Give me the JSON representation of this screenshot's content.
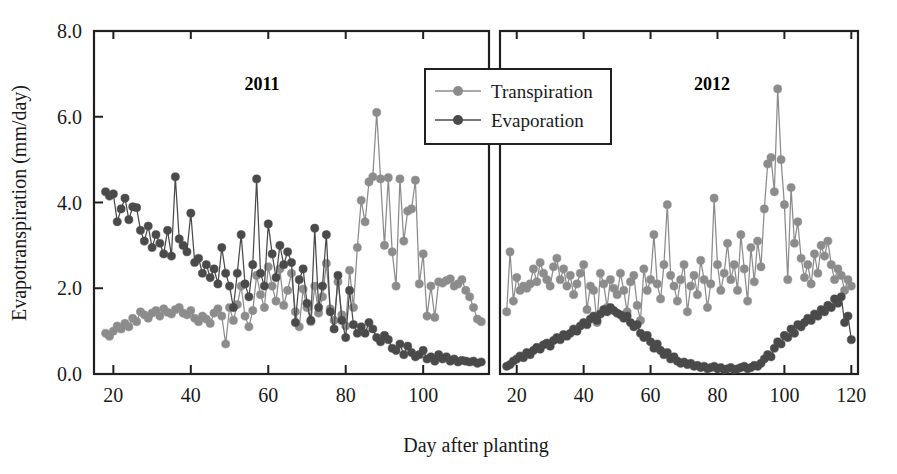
{
  "chart_data": {
    "type": "line",
    "title": "",
    "xlabel": "Day after planting",
    "ylabel": "Evapotranspiration (mm/day)",
    "ylim": [
      0.0,
      8.0
    ],
    "yticks": [
      "0.0",
      "2.0",
      "4.0",
      "6.0",
      "8.0"
    ],
    "ytick_values": [
      0.0,
      2.0,
      4.0,
      6.0,
      8.0
    ],
    "grid": false,
    "legend_position": "top-center",
    "marker": "filled-circle",
    "panels": [
      {
        "label": "2011",
        "xlim": [
          15,
          117
        ],
        "xticks": [
          "20",
          "40",
          "60",
          "80",
          "100"
        ],
        "xtick_values": [
          20,
          40,
          60,
          80,
          100
        ]
      },
      {
        "label": "2012",
        "xlim": [
          15,
          122
        ],
        "xticks": [
          "20",
          "40",
          "60",
          "80",
          "100",
          "120"
        ],
        "xtick_values": [
          20,
          40,
          60,
          80,
          100,
          120
        ]
      }
    ],
    "series": [
      {
        "name": "Transpiration",
        "color": "#8c8c8c",
        "panels": [
          {
            "panel": "2011",
            "x": [
              18,
              19,
              20,
              21,
              22,
              23,
              24,
              25,
              26,
              27,
              28,
              29,
              30,
              31,
              32,
              33,
              34,
              35,
              36,
              37,
              38,
              39,
              40,
              41,
              42,
              43,
              44,
              45,
              46,
              47,
              48,
              49,
              50,
              51,
              52,
              53,
              54,
              55,
              56,
              57,
              58,
              59,
              60,
              61,
              62,
              63,
              64,
              65,
              66,
              67,
              68,
              69,
              70,
              71,
              72,
              73,
              74,
              75,
              76,
              77,
              78,
              79,
              80,
              81,
              82,
              83,
              84,
              85,
              86,
              87,
              88,
              89,
              90,
              91,
              92,
              93,
              94,
              95,
              96,
              97,
              98,
              99,
              100,
              101,
              102,
              103,
              104,
              105,
              106,
              107,
              108,
              109,
              110,
              111,
              112,
              113,
              114,
              115
            ],
            "y": [
              0.95,
              0.88,
              1.0,
              1.12,
              1.05,
              1.18,
              1.1,
              1.3,
              1.22,
              1.45,
              1.38,
              1.3,
              1.42,
              1.48,
              1.35,
              1.52,
              1.44,
              1.4,
              1.5,
              1.55,
              1.42,
              1.38,
              1.48,
              1.3,
              1.22,
              1.35,
              1.28,
              1.18,
              1.42,
              1.52,
              1.35,
              0.7,
              1.55,
              1.25,
              1.62,
              2.05,
              1.35,
              1.1,
              1.48,
              2.3,
              1.85,
              1.55,
              2.5,
              2.05,
              1.7,
              2.45,
              1.6,
              1.95,
              2.35,
              1.45,
              1.1,
              1.98,
              1.55,
              1.22,
              2.05,
              1.42,
              1.8,
              2.58,
              1.52,
              1.25,
              2.15,
              1.38,
              1.12,
              2.42,
              1.55,
              2.95,
              4.05,
              3.55,
              4.48,
              4.6,
              6.1,
              4.55,
              3.0,
              4.58,
              2.85,
              2.05,
              4.55,
              3.1,
              3.8,
              3.85,
              4.52,
              2.1,
              2.8,
              1.35,
              2.05,
              1.32,
              2.15,
              2.12,
              2.18,
              2.22,
              2.05,
              2.1,
              2.2,
              1.95,
              1.8,
              1.55,
              1.28,
              1.22
            ]
          },
          {
            "panel": "2012",
            "x": [
              17,
              18,
              19,
              20,
              21,
              22,
              23,
              24,
              25,
              26,
              27,
              28,
              29,
              30,
              31,
              32,
              33,
              34,
              35,
              36,
              37,
              38,
              39,
              40,
              41,
              42,
              43,
              44,
              45,
              46,
              47,
              48,
              49,
              50,
              51,
              52,
              53,
              54,
              55,
              56,
              57,
              58,
              59,
              60,
              61,
              62,
              63,
              64,
              65,
              66,
              67,
              68,
              69,
              70,
              71,
              72,
              73,
              74,
              75,
              76,
              77,
              78,
              79,
              80,
              81,
              82,
              83,
              84,
              85,
              86,
              87,
              88,
              89,
              90,
              91,
              92,
              93,
              94,
              95,
              96,
              97,
              98,
              99,
              100,
              101,
              102,
              103,
              104,
              105,
              106,
              107,
              108,
              109,
              110,
              111,
              112,
              113,
              114,
              115,
              116,
              117,
              118,
              119,
              120
            ],
            "y": [
              1.45,
              2.85,
              1.7,
              2.25,
              1.95,
              2.05,
              2.0,
              2.1,
              2.45,
              2.15,
              2.6,
              2.35,
              2.2,
              2.05,
              2.5,
              2.7,
              2.2,
              2.45,
              2.05,
              2.3,
              1.85,
              2.1,
              2.35,
              2.55,
              1.5,
              2.05,
              1.95,
              1.2,
              2.35,
              2.1,
              1.55,
              2.2,
              2.0,
              1.85,
              2.35,
              1.95,
              1.45,
              2.15,
              2.3,
              1.6,
              1.25,
              2.45,
              1.95,
              2.2,
              3.25,
              2.1,
              1.75,
              2.55,
              3.95,
              2.3,
              2.05,
              1.7,
              2.2,
              2.55,
              1.45,
              2.05,
              2.3,
              1.85,
              2.65,
              2.2,
              1.55,
              2.1,
              4.1,
              2.55,
              1.95,
              2.35,
              3.05,
              2.2,
              2.55,
              1.95,
              3.25,
              2.45,
              1.7,
              2.95,
              2.15,
              3.1,
              2.5,
              3.85,
              4.9,
              5.05,
              4.25,
              6.65,
              5.0,
              3.95,
              2.2,
              4.35,
              3.05,
              3.55,
              2.7,
              2.25,
              2.55,
              2.1,
              2.8,
              2.35,
              3.0,
              2.75,
              3.1,
              2.55,
              2.2,
              2.45,
              2.3,
              1.95,
              2.2,
              2.05
            ]
          }
        ]
      },
      {
        "name": "Evaporation",
        "color": "#4a4a4a",
        "panels": [
          {
            "panel": "2011",
            "x": [
              18,
              19,
              20,
              21,
              22,
              23,
              24,
              25,
              26,
              27,
              28,
              29,
              30,
              31,
              32,
              33,
              34,
              35,
              36,
              37,
              38,
              39,
              40,
              41,
              42,
              43,
              44,
              45,
              46,
              47,
              48,
              49,
              50,
              51,
              52,
              53,
              54,
              55,
              56,
              57,
              58,
              59,
              60,
              61,
              62,
              63,
              64,
              65,
              66,
              67,
              68,
              69,
              70,
              71,
              72,
              73,
              74,
              75,
              76,
              77,
              78,
              79,
              80,
              81,
              82,
              83,
              84,
              85,
              86,
              87,
              88,
              89,
              90,
              91,
              92,
              93,
              94,
              95,
              96,
              97,
              98,
              99,
              100,
              101,
              102,
              103,
              104,
              105,
              106,
              107,
              108,
              109,
              110,
              111,
              112,
              113,
              114,
              115
            ],
            "y": [
              4.25,
              4.15,
              4.2,
              3.55,
              3.85,
              4.1,
              3.6,
              3.9,
              3.88,
              3.35,
              3.1,
              3.45,
              2.95,
              3.25,
              3.05,
              2.8,
              3.35,
              2.75,
              4.6,
              3.15,
              3.0,
              2.85,
              3.75,
              2.6,
              2.7,
              2.35,
              2.55,
              2.25,
              2.45,
              2.1,
              2.95,
              2.35,
              2.05,
              1.55,
              2.35,
              3.25,
              2.1,
              1.8,
              2.55,
              4.55,
              2.35,
              2.05,
              3.5,
              2.8,
              2.25,
              3.0,
              2.55,
              2.85,
              2.6,
              1.2,
              2.2,
              2.45,
              1.65,
              1.25,
              3.4,
              1.55,
              2.05,
              3.25,
              1.45,
              1.05,
              2.3,
              1.25,
              0.85,
              1.95,
              1.15,
              0.95,
              1.1,
              0.95,
              1.2,
              1.05,
              0.85,
              0.75,
              0.9,
              0.8,
              0.6,
              0.55,
              0.7,
              0.45,
              0.65,
              0.5,
              0.4,
              0.45,
              0.55,
              0.35,
              0.4,
              0.3,
              0.45,
              0.35,
              0.4,
              0.3,
              0.35,
              0.28,
              0.32,
              0.3,
              0.28,
              0.3,
              0.25,
              0.28
            ]
          },
          {
            "panel": "2012",
            "x": [
              17,
              18,
              19,
              20,
              21,
              22,
              23,
              24,
              25,
              26,
              27,
              28,
              29,
              30,
              31,
              32,
              33,
              34,
              35,
              36,
              37,
              38,
              39,
              40,
              41,
              42,
              43,
              44,
              45,
              46,
              47,
              48,
              49,
              50,
              51,
              52,
              53,
              54,
              55,
              56,
              57,
              58,
              59,
              60,
              61,
              62,
              63,
              64,
              65,
              66,
              67,
              68,
              69,
              70,
              71,
              72,
              73,
              74,
              75,
              76,
              77,
              78,
              79,
              80,
              81,
              82,
              83,
              84,
              85,
              86,
              87,
              88,
              89,
              90,
              91,
              92,
              93,
              94,
              95,
              96,
              97,
              98,
              99,
              100,
              101,
              102,
              103,
              104,
              105,
              106,
              107,
              108,
              109,
              110,
              111,
              112,
              113,
              114,
              115,
              116,
              117,
              118,
              119,
              120
            ],
            "y": [
              0.18,
              0.22,
              0.3,
              0.35,
              0.42,
              0.38,
              0.5,
              0.45,
              0.55,
              0.62,
              0.58,
              0.68,
              0.72,
              0.65,
              0.78,
              0.85,
              0.8,
              0.92,
              0.88,
              0.95,
              1.05,
              1.0,
              1.12,
              1.2,
              1.15,
              1.28,
              1.35,
              1.25,
              1.4,
              1.5,
              1.45,
              1.55,
              1.48,
              1.42,
              1.38,
              1.3,
              1.35,
              1.2,
              1.1,
              1.15,
              0.95,
              0.85,
              0.9,
              0.75,
              0.6,
              0.7,
              0.55,
              0.45,
              0.5,
              0.35,
              0.4,
              0.3,
              0.25,
              0.28,
              0.22,
              0.25,
              0.18,
              0.2,
              0.15,
              0.18,
              0.12,
              0.15,
              0.18,
              0.12,
              0.15,
              0.1,
              0.12,
              0.15,
              0.1,
              0.12,
              0.15,
              0.18,
              0.12,
              0.15,
              0.2,
              0.18,
              0.25,
              0.35,
              0.45,
              0.4,
              0.6,
              0.75,
              0.7,
              0.9,
              0.85,
              1.05,
              0.95,
              1.15,
              1.1,
              1.2,
              1.3,
              1.25,
              1.4,
              1.35,
              1.5,
              1.45,
              1.6,
              1.55,
              1.75,
              1.65,
              1.8,
              1.2,
              1.35,
              0.8
            ]
          }
        ]
      }
    ]
  },
  "legend": {
    "entries": [
      {
        "label": "Transpiration",
        "color": "#8c8c8c"
      },
      {
        "label": "Evaporation",
        "color": "#4a4a4a"
      }
    ]
  },
  "axes": {
    "y_title": "Evapotranspiration (mm/day)",
    "x_title": "Day after planting"
  }
}
